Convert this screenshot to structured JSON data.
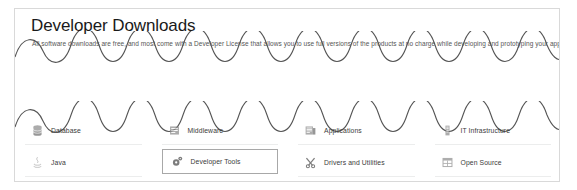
{
  "card": {
    "title": "Developer Downloads",
    "subtitle": "All software downloads are free, and most come with a Developer License that allows you to use full versions of the products at no charge while developing and prototyping your applications.",
    "accent_color": "#a8a8a8",
    "border_color": "#d9d9d9",
    "divider_color": "#eceded",
    "wave_color": "#555555"
  },
  "categories": {
    "row1": [
      {
        "label": "Database",
        "icon": "database-icon",
        "selected": false
      },
      {
        "label": "Middleware",
        "icon": "middleware-icon",
        "selected": false
      },
      {
        "label": "Applications",
        "icon": "applications-icon",
        "selected": false
      },
      {
        "label": "IT Infrastructure",
        "icon": "it-infrastructure-icon",
        "selected": false
      }
    ],
    "row2": [
      {
        "label": "Java",
        "icon": "java-icon",
        "selected": false
      },
      {
        "label": "Developer Tools",
        "icon": "developer-tools-icon",
        "selected": true
      },
      {
        "label": "Drivers and Utilities",
        "icon": "drivers-icon",
        "selected": false
      },
      {
        "label": "Open Source",
        "icon": "open-source-icon",
        "selected": false
      }
    ]
  }
}
